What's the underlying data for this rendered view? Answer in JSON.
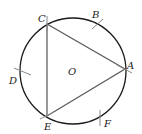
{
  "diagram": {
    "type": "inscribed equilateral triangle in circle",
    "circle": {
      "center_label": "O",
      "cx": 73,
      "cy": 71,
      "r": 53
    },
    "triangle": {
      "vertices": [
        "A",
        "C",
        "E"
      ]
    },
    "points": {
      "A": {
        "label": "A",
        "x": 125,
        "y": 69
      },
      "B": {
        "label": "B",
        "x": 97,
        "y": 24
      },
      "C": {
        "label": "C",
        "x": 47,
        "y": 24
      },
      "D": {
        "label": "D",
        "x": 21,
        "y": 73
      },
      "E": {
        "label": "E",
        "x": 47,
        "y": 116
      },
      "F": {
        "label": "F",
        "x": 100,
        "y": 118
      },
      "O": {
        "label": "O"
      }
    },
    "colors": {
      "circle": "#1a1a1a",
      "triangle": "#555555",
      "ticks": "#888888"
    }
  }
}
